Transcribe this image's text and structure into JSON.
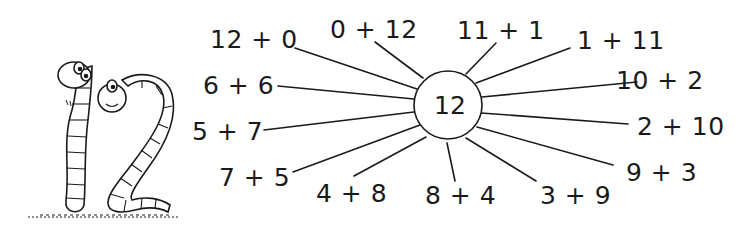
{
  "diagram": {
    "center": "12",
    "illustration": "two-worms-forming-number-12",
    "expressions": [
      {
        "text": "12 + 0",
        "x": 210,
        "y": 27
      },
      {
        "text": "0 + 12",
        "x": 330,
        "y": 17
      },
      {
        "text": "11 + 1",
        "x": 457,
        "y": 18
      },
      {
        "text": "1 + 11",
        "x": 577,
        "y": 28
      },
      {
        "text": "10 + 2",
        "x": 616,
        "y": 68
      },
      {
        "text": "2 + 10",
        "x": 637,
        "y": 114
      },
      {
        "text": "9 + 3",
        "x": 626,
        "y": 160
      },
      {
        "text": "3 + 9",
        "x": 540,
        "y": 183
      },
      {
        "text": "8 + 4",
        "x": 425,
        "y": 183
      },
      {
        "text": "4 + 8",
        "x": 316,
        "y": 181
      },
      {
        "text": "7 + 5",
        "x": 219,
        "y": 165
      },
      {
        "text": "5 + 7",
        "x": 192,
        "y": 119
      },
      {
        "text": "6 + 6",
        "x": 203,
        "y": 73
      }
    ],
    "colors": {
      "ink": "#1a1a1a",
      "background": "#ffffff"
    }
  }
}
